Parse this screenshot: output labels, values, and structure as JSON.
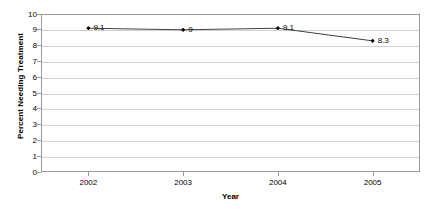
{
  "chart_data": {
    "type": "line",
    "title": "",
    "xlabel": "Year",
    "ylabel": "Percent Needing Treatment",
    "categories": [
      "2002",
      "2003",
      "2004",
      "2005"
    ],
    "values": [
      9.1,
      9,
      9.1,
      8.3
    ],
    "point_labels": [
      "9.1",
      "9",
      "9.1",
      "8.3"
    ],
    "ylim": [
      0,
      10
    ],
    "y_ticks": [
      "0",
      "1",
      "2",
      "3",
      "4",
      "5",
      "6",
      "7",
      "8",
      "9",
      "10"
    ],
    "grid": true,
    "legend": "none",
    "series": [
      {
        "name": "Percent Needing Treatment",
        "values": [
          9.1,
          9,
          9.1,
          8.3
        ],
        "line_color": "#404040",
        "marker_color": "#000000",
        "marker": "diamond"
      }
    ],
    "colors": {
      "background": "#ffffff",
      "gridline": "#d0d0d0",
      "axis": "#9a9a9a",
      "text": "#000000",
      "line": "#404040"
    }
  }
}
